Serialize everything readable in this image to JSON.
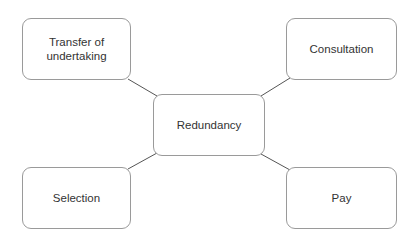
{
  "diagram": {
    "type": "mind-map",
    "center": {
      "id": "redundancy",
      "label": "Redundancy"
    },
    "nodes": [
      {
        "id": "transfer",
        "label": "Transfer of undertaking"
      },
      {
        "id": "consultation",
        "label": "Consultation"
      },
      {
        "id": "selection",
        "label": "Selection"
      },
      {
        "id": "pay",
        "label": "Pay"
      }
    ],
    "edges": [
      {
        "from": "redundancy",
        "to": "transfer"
      },
      {
        "from": "redundancy",
        "to": "consultation"
      },
      {
        "from": "redundancy",
        "to": "selection"
      },
      {
        "from": "redundancy",
        "to": "pay"
      }
    ],
    "colors": {
      "border": "#9a9a9a",
      "line": "#555555",
      "text": "#333333",
      "background": "#ffffff"
    }
  }
}
